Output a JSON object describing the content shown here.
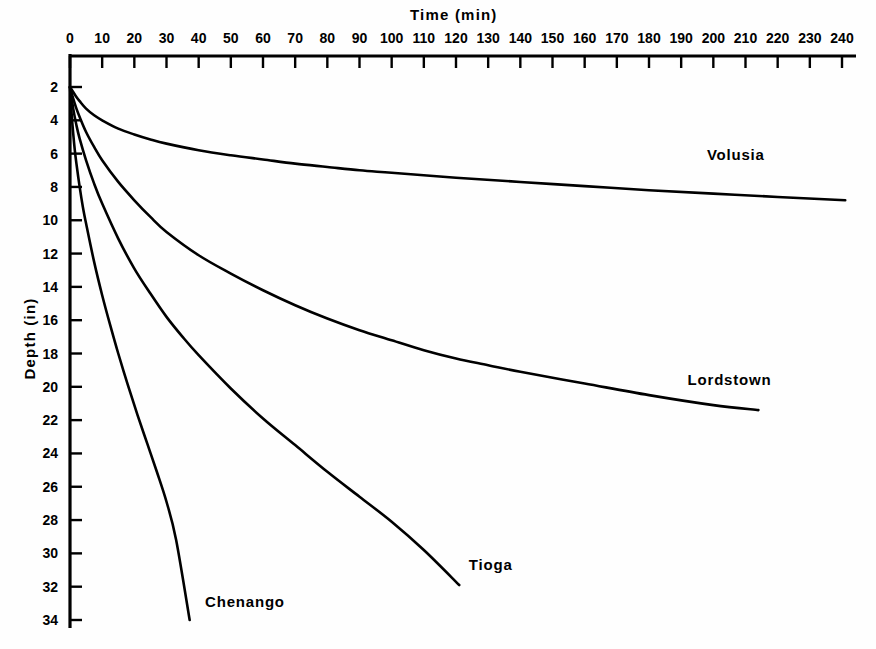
{
  "chart_data": {
    "type": "line",
    "title": "",
    "xlabel": "Time (min)",
    "ylabel": "Depth (in)",
    "xlim": [
      0,
      240
    ],
    "ylim": [
      2,
      34
    ],
    "y_inverted": true,
    "x_axis_position": "top",
    "y_axis_position": "left",
    "grid": false,
    "legend": "inline-labels",
    "x_ticks": [
      0,
      10,
      20,
      30,
      40,
      50,
      60,
      70,
      80,
      90,
      100,
      110,
      120,
      130,
      140,
      150,
      160,
      170,
      180,
      190,
      200,
      210,
      220,
      230,
      240
    ],
    "x_tick_labels": [
      "0",
      "10",
      "20",
      "30",
      "40",
      "50",
      "60",
      "70",
      "80",
      "90",
      "100",
      "110",
      "120",
      "130",
      "140",
      "150",
      "160",
      "170",
      "180",
      "190",
      "200",
      "210",
      "220",
      "230",
      "240"
    ],
    "y_ticks": [
      2,
      4,
      6,
      8,
      10,
      12,
      14,
      16,
      18,
      20,
      22,
      24,
      26,
      28,
      30,
      32,
      34
    ],
    "y_tick_labels": [
      "2",
      "4",
      "6",
      "8",
      "10",
      "12",
      "14",
      "16",
      "18",
      "20",
      "22",
      "24",
      "26",
      "28",
      "30",
      "32",
      "34"
    ],
    "line_color": "#000000",
    "series": [
      {
        "name": "Volusia",
        "label_x": 198,
        "label_y": 6.1,
        "x": [
          0,
          1,
          2,
          3,
          5,
          7.5,
          10,
          15,
          20,
          25,
          30,
          40,
          50,
          60,
          70,
          80,
          90,
          100,
          120,
          140,
          160,
          180,
          200,
          220,
          241
        ],
        "y": [
          2.0,
          2.3,
          2.6,
          2.85,
          3.3,
          3.7,
          4.0,
          4.5,
          4.85,
          5.15,
          5.4,
          5.8,
          6.1,
          6.35,
          6.6,
          6.8,
          7.0,
          7.15,
          7.45,
          7.7,
          7.95,
          8.2,
          8.4,
          8.6,
          8.8
        ]
      },
      {
        "name": "Lordstown",
        "label_x": 192,
        "label_y": 19.6,
        "x": [
          0,
          1,
          2,
          3,
          5,
          7.5,
          10,
          15,
          20,
          25,
          30,
          40,
          50,
          60,
          70,
          80,
          90,
          100,
          110,
          120,
          130,
          140,
          160,
          180,
          200,
          214
        ],
        "y": [
          2.0,
          2.7,
          3.3,
          3.8,
          4.7,
          5.6,
          6.4,
          7.7,
          8.8,
          9.8,
          10.7,
          12.1,
          13.2,
          14.2,
          15.1,
          15.9,
          16.6,
          17.2,
          17.8,
          18.3,
          18.7,
          19.1,
          19.8,
          20.5,
          21.1,
          21.4
        ]
      },
      {
        "name": "Tioga",
        "label_x": 124,
        "label_y": 30.7,
        "x": [
          0,
          1,
          2,
          3,
          5,
          7.5,
          10,
          15,
          20,
          25,
          30,
          35,
          40,
          50,
          60,
          70,
          80,
          90,
          100,
          110,
          121
        ],
        "y": [
          2.0,
          3.3,
          4.3,
          5.1,
          6.4,
          7.8,
          9.0,
          11.1,
          12.9,
          14.4,
          15.8,
          17.0,
          18.1,
          20.1,
          21.9,
          23.5,
          25.1,
          26.6,
          28.1,
          29.8,
          31.9
        ]
      },
      {
        "name": "Chenango",
        "label_x": 42,
        "label_y": 32.9,
        "x": [
          0,
          0.5,
          1,
          1.5,
          2,
          3,
          4,
          5,
          7.5,
          10,
          12.5,
          15,
          18,
          21,
          24,
          27,
          30,
          33,
          37.2
        ],
        "y": [
          2.0,
          3.6,
          4.8,
          5.8,
          6.6,
          8.0,
          9.2,
          10.2,
          12.5,
          14.5,
          16.3,
          18.0,
          19.9,
          21.7,
          23.4,
          25.1,
          26.9,
          29.2,
          34.0
        ]
      }
    ]
  }
}
